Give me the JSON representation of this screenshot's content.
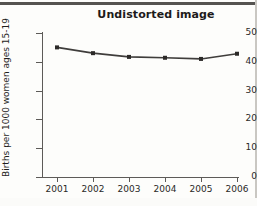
{
  "figure": {
    "title": "Undistorted image",
    "has_top_rule": true,
    "has_right_rule": true,
    "background_color": "#fdfdfb",
    "ink_color": "#3f3d3b"
  },
  "chart_data": {
    "type": "line",
    "title": "Undistorted image",
    "xlabel": "",
    "ylabel": "Births per 1000 women ages 15-19",
    "categories": [
      "2001",
      "2002",
      "2003",
      "2004",
      "2005",
      "2006"
    ],
    "x": [
      2001,
      2002,
      2003,
      2004,
      2005,
      2006
    ],
    "values": [
      45,
      43,
      41.7,
      41.4,
      41,
      42.8
    ],
    "series": [
      {
        "name": "Births per 1000 women ages 15-19",
        "values": [
          45,
          43,
          41.7,
          41.4,
          41,
          42.8
        ]
      }
    ],
    "ylim": [
      0,
      50
    ],
    "yticks": [
      0,
      10,
      20,
      30,
      40,
      50
    ],
    "ytick_labels": [
      "0",
      "10",
      "20",
      "30",
      "40",
      "50"
    ],
    "xtick_labels": [
      "2001",
      "2002",
      "2003",
      "2004",
      "2005",
      "2006"
    ],
    "grid": false,
    "legend": null,
    "marker": "square",
    "line_color": "#3f3d3b",
    "marker_color": "#2c2a28"
  }
}
